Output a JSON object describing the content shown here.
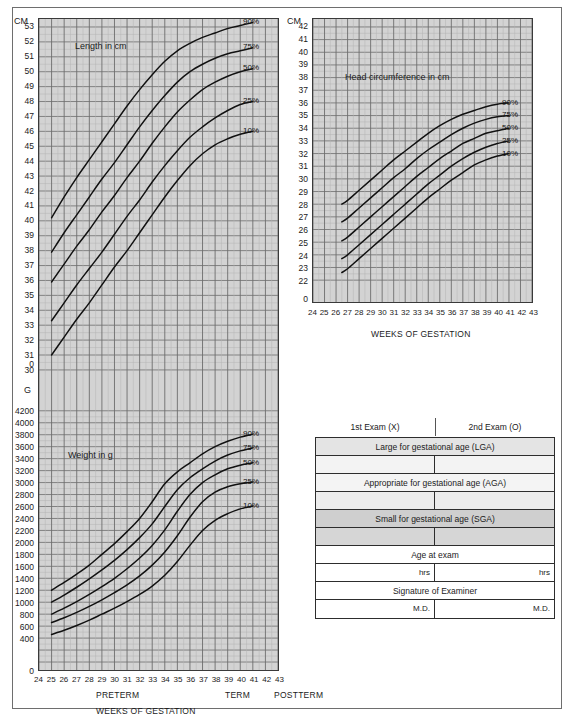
{
  "document": {
    "type": "newborn-classification-growth-chart"
  },
  "length_chart": {
    "unit_label": "CM",
    "title": "Length in cm",
    "y_ticks": [
      53,
      52,
      51,
      50,
      49,
      48,
      47,
      46,
      45,
      44,
      43,
      42,
      41,
      40,
      39,
      38,
      37,
      36,
      35,
      34,
      33,
      32,
      31,
      30
    ],
    "y_zero_label": "0",
    "percentile_labels": [
      "90%",
      "75%",
      "50%",
      "25%",
      "10%"
    ]
  },
  "weight_chart": {
    "unit_label": "G",
    "title": "Weight in g",
    "y_ticks": [
      4200,
      4000,
      3800,
      3600,
      3400,
      3200,
      3000,
      2800,
      2600,
      2400,
      2200,
      2000,
      1800,
      1600,
      1400,
      1200,
      1000,
      800,
      600,
      400
    ],
    "y_zero_label": "0",
    "percentile_labels": [
      "90%",
      "75%",
      "50%",
      "25%",
      "10%"
    ],
    "x_ticks": [
      "24",
      "25",
      "26",
      "27",
      "28",
      "29",
      "30",
      "31",
      "32",
      "33",
      "34",
      "35",
      "36",
      "37",
      "38",
      "39",
      "40",
      "41",
      "42",
      "43"
    ],
    "x_caption": "WEEKS OF GESTATION",
    "stage_preterm": "PRETERM",
    "stage_term": "TERM",
    "stage_postterm": "POSTTERM"
  },
  "head_chart": {
    "unit_label": "CM",
    "title": "Head circumference in cm",
    "y_ticks": [
      42,
      41,
      40,
      39,
      38,
      37,
      36,
      35,
      34,
      33,
      32,
      31,
      30,
      29,
      28,
      27,
      26,
      25,
      24,
      23,
      22
    ],
    "y_zero_label": "0",
    "percentile_labels": [
      "90%",
      "75%",
      "50%",
      "25%",
      "10%"
    ],
    "x_ticks": [
      "24",
      "25",
      "26",
      "27",
      "28",
      "29",
      "30",
      "31",
      "32",
      "33",
      "34",
      "35",
      "36",
      "37",
      "38",
      "39",
      "40",
      "41",
      "42",
      "43"
    ],
    "x_caption": "WEEKS OF GESTATION"
  },
  "exam_table": {
    "header": [
      "1st Exam (X)",
      "2nd Exam (O)"
    ],
    "rows": [
      {
        "kind": "full",
        "label": "Large for gestational age (LGA)",
        "tone": "tone-lga"
      },
      {
        "kind": "split",
        "left": "",
        "right": "",
        "tone": "tone-lga-blank"
      },
      {
        "kind": "full",
        "label": "Appropriate for gestational age (AGA)",
        "tone": "tone-aga"
      },
      {
        "kind": "split",
        "left": "",
        "right": "",
        "tone": "tone-aga-blank"
      },
      {
        "kind": "full",
        "label": "Small for gestational age (SGA)",
        "tone": "tone-sga"
      },
      {
        "kind": "split",
        "left": "",
        "right": "",
        "tone": "tone-sga-blank"
      },
      {
        "kind": "full",
        "label": "Age at exam",
        "tone": "tone-plain"
      },
      {
        "kind": "split",
        "left": "hrs",
        "right": "hrs",
        "tone": "tone-plain"
      },
      {
        "kind": "full",
        "label": "Signature of Examiner",
        "tone": "tone-plain"
      },
      {
        "kind": "split",
        "left": "M.D.",
        "right": "M.D.",
        "tone": "tone-plain"
      }
    ]
  },
  "colors": {
    "plot_background": "#d3d3d3",
    "grid_minor": "#b4b4b4",
    "grid_major": "#6d6d6d",
    "curve": "#111111",
    "frame": "#6e6e6e"
  },
  "chart_data": [
    {
      "type": "line",
      "title": "Length in cm",
      "xlabel": "WEEKS OF GESTATION",
      "ylabel": "CM",
      "xlim": [
        24,
        43
      ],
      "ylim": [
        30,
        53
      ],
      "grid": true,
      "legend_position": "right-inline",
      "x": [
        25,
        26,
        27,
        28,
        29,
        30,
        31,
        32,
        33,
        34,
        35,
        36,
        37,
        38,
        39,
        40,
        41
      ],
      "series": [
        {
          "name": "90%",
          "values": [
            40.2,
            41.6,
            42.9,
            44.1,
            45.3,
            46.5,
            47.7,
            48.8,
            49.8,
            50.7,
            51.4,
            51.9,
            52.3,
            52.6,
            52.9,
            53.1,
            53.3
          ]
        },
        {
          "name": "75%",
          "values": [
            37.9,
            39.2,
            40.4,
            41.6,
            42.8,
            43.9,
            45.1,
            46.3,
            47.4,
            48.4,
            49.3,
            50.0,
            50.5,
            50.9,
            51.2,
            51.4,
            51.6
          ]
        },
        {
          "name": "50%",
          "values": [
            35.9,
            37.1,
            38.3,
            39.4,
            40.6,
            41.7,
            42.9,
            44.0,
            45.2,
            46.3,
            47.3,
            48.1,
            48.8,
            49.3,
            49.7,
            50.0,
            50.2
          ]
        },
        {
          "name": "25%",
          "values": [
            33.3,
            34.5,
            35.7,
            36.8,
            37.9,
            39.1,
            40.3,
            41.4,
            42.6,
            43.7,
            44.7,
            45.6,
            46.3,
            46.9,
            47.4,
            47.8,
            48.0
          ]
        },
        {
          "name": "10%",
          "values": [
            31.0,
            32.2,
            33.4,
            34.5,
            35.7,
            36.9,
            38.0,
            39.2,
            40.4,
            41.6,
            42.7,
            43.7,
            44.5,
            45.1,
            45.5,
            45.8,
            46.0
          ]
        }
      ]
    },
    {
      "type": "line",
      "title": "Weight in g",
      "xlabel": "WEEKS OF GESTATION",
      "ylabel": "G",
      "xlim": [
        24,
        43
      ],
      "ylim": [
        0,
        4200
      ],
      "grid": true,
      "legend_position": "right-inline",
      "x": [
        25,
        26,
        27,
        28,
        29,
        30,
        31,
        32,
        33,
        34,
        35,
        36,
        37,
        38,
        39,
        40,
        41
      ],
      "series": [
        {
          "name": "90%",
          "values": [
            1200,
            1330,
            1470,
            1620,
            1800,
            1980,
            2180,
            2400,
            2680,
            2980,
            3180,
            3330,
            3480,
            3600,
            3690,
            3760,
            3810
          ]
        },
        {
          "name": "75%",
          "values": [
            1000,
            1120,
            1250,
            1390,
            1540,
            1700,
            1880,
            2080,
            2310,
            2600,
            2880,
            3080,
            3230,
            3360,
            3460,
            3530,
            3580
          ]
        },
        {
          "name": "50%",
          "values": [
            800,
            900,
            1010,
            1130,
            1260,
            1400,
            1560,
            1740,
            1950,
            2210,
            2520,
            2800,
            3000,
            3130,
            3230,
            3290,
            3330
          ]
        },
        {
          "name": "25%",
          "values": [
            660,
            740,
            830,
            930,
            1040,
            1160,
            1290,
            1440,
            1620,
            1840,
            2110,
            2420,
            2680,
            2840,
            2930,
            2980,
            3010
          ]
        },
        {
          "name": "10%",
          "values": [
            460,
            530,
            610,
            700,
            800,
            900,
            1010,
            1130,
            1270,
            1450,
            1680,
            1950,
            2200,
            2370,
            2480,
            2560,
            2610
          ]
        }
      ]
    },
    {
      "type": "line",
      "title": "Head circumference in cm",
      "xlabel": "WEEKS OF GESTATION",
      "ylabel": "CM",
      "xlim": [
        24,
        43
      ],
      "ylim": [
        22,
        42
      ],
      "grid": true,
      "legend_position": "right-inline",
      "x": [
        26.5,
        27,
        28,
        29,
        30,
        31,
        32,
        33,
        34,
        35,
        36,
        37,
        38,
        39,
        40,
        41
      ],
      "series": [
        {
          "name": "90%",
          "values": [
            28.0,
            28.3,
            29.1,
            29.9,
            30.7,
            31.5,
            32.2,
            32.9,
            33.6,
            34.2,
            34.7,
            35.1,
            35.4,
            35.7,
            35.9,
            36.0
          ]
        },
        {
          "name": "75%",
          "values": [
            26.6,
            26.9,
            27.7,
            28.5,
            29.3,
            30.1,
            30.8,
            31.6,
            32.3,
            32.9,
            33.5,
            34.0,
            34.4,
            34.7,
            34.9,
            35.0
          ]
        },
        {
          "name": "50%",
          "values": [
            25.1,
            25.4,
            26.2,
            27.0,
            27.8,
            28.6,
            29.4,
            30.2,
            30.9,
            31.6,
            32.2,
            32.8,
            33.2,
            33.6,
            33.8,
            34.0
          ]
        },
        {
          "name": "25%",
          "values": [
            23.7,
            24.0,
            24.8,
            25.6,
            26.4,
            27.2,
            28.0,
            28.8,
            29.6,
            30.3,
            31.0,
            31.6,
            32.1,
            32.5,
            32.8,
            33.0
          ]
        },
        {
          "name": "10%",
          "values": [
            22.6,
            22.9,
            23.7,
            24.5,
            25.3,
            26.1,
            26.9,
            27.7,
            28.5,
            29.2,
            29.9,
            30.5,
            31.1,
            31.5,
            31.8,
            32.0
          ]
        }
      ]
    }
  ]
}
